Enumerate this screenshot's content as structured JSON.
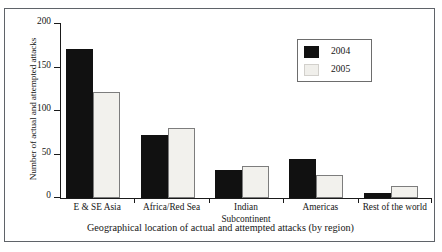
{
  "chart_data": {
    "type": "bar",
    "title": "",
    "xlabel": "Geographical location of actual and attempted attacks (by region)",
    "ylabel": "Number of actual and attempted attacks",
    "categories": [
      "E & SE Asia",
      "Africa/Red Sea",
      "Indian\nSubcontinent",
      "Americas",
      "Rest of the world"
    ],
    "series": [
      {
        "name": "2004",
        "color": "#111111",
        "values": [
          171,
          73,
          32,
          45,
          6
        ]
      },
      {
        "name": "2005",
        "color": "#f2f1ed",
        "values": [
          122,
          80,
          37,
          26,
          14
        ]
      }
    ],
    "ylim": [
      0,
      200
    ],
    "yticks": [
      0,
      50,
      100,
      150,
      200
    ],
    "ytick_labels": [
      "0",
      "50",
      "100",
      "150",
      "200"
    ],
    "grid": false,
    "legend_position": "upper right",
    "legend_entries": [
      "2004",
      "2005"
    ]
  }
}
